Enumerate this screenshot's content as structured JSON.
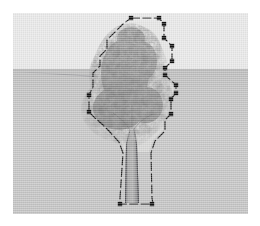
{
  "window": {
    "title": "Tree Model Viewport",
    "kind": "3d-modeling-viewport"
  },
  "canvas": {
    "width": 260,
    "height": 226,
    "margin": 13,
    "viewport_width": 235,
    "viewport_height": 201,
    "background_color": "#ffffff"
  },
  "scene": {
    "sky_color": "#e8e8e8",
    "ground_color": "#c6c6c6",
    "horizon_color": "#a7a7a7",
    "horizon_y": 56,
    "guide_line_color": "#6c6c76",
    "texture": "dithered-halftone"
  },
  "model": {
    "name": "tree",
    "type": "2d-face-me-component",
    "foliage_color": "#6f6f6f",
    "foliage_highlight_color": "#b8b8b8",
    "trunk_color": "#9b9b9b",
    "trunk_edge_color": "#4e4e52",
    "halo_color": "#e2e2e0"
  },
  "selection": {
    "active": true,
    "style": "dashed-outline",
    "stroke_color": "#1d1d1d",
    "grip_color": "#121212",
    "grip_count": 16,
    "outline_points": "118,5 146,5 151,11 151,25 159,33 159,48 152,55 152,62 163,72 163,80 158,86 158,101 152,107 152,118 142,128 138,140 139,185 140,191 107,191 107,185 110,140 106,129 96,118 90,112 82,105 76,99 76,82 80,74 80,60 87,53 87,43 94,36 94,27 103,18 110,11 118,5",
    "grips": [
      {
        "x": 118,
        "y": 5
      },
      {
        "x": 146,
        "y": 5
      },
      {
        "x": 151,
        "y": 11
      },
      {
        "x": 151,
        "y": 25
      },
      {
        "x": 159,
        "y": 33
      },
      {
        "x": 159,
        "y": 48
      },
      {
        "x": 152,
        "y": 55
      },
      {
        "x": 152,
        "y": 62
      },
      {
        "x": 163,
        "y": 72
      },
      {
        "x": 163,
        "y": 80
      },
      {
        "x": 158,
        "y": 86
      },
      {
        "x": 158,
        "y": 101
      },
      {
        "x": 139,
        "y": 191
      },
      {
        "x": 107,
        "y": 191
      },
      {
        "x": 76,
        "y": 99
      },
      {
        "x": 76,
        "y": 82
      }
    ]
  },
  "trunk": {
    "left_x": 112,
    "right_x": 126,
    "top_y": 112,
    "bottom_y": 190
  }
}
